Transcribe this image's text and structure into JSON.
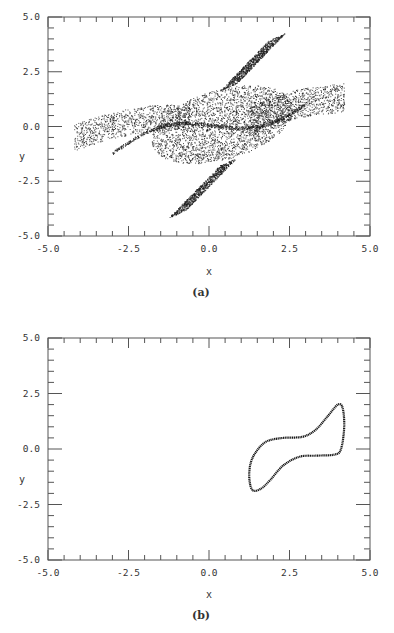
{
  "chart_data": [
    {
      "type": "scatter",
      "panel": "a",
      "caption": "(a)",
      "title": "",
      "xlabel": "x",
      "ylabel": "y",
      "xlim": [
        -5.0,
        5.0
      ],
      "ylim": [
        -5.0,
        5.0
      ],
      "xticks": [
        "-5.0",
        "-2.5",
        "0.0",
        "2.5",
        "5.0"
      ],
      "yticks": [
        "-5.0",
        "-2.5",
        "0.0",
        "2.5",
        "5.0"
      ],
      "grid": false,
      "legend": null,
      "description": "Dense dotted chaotic/quasi-periodic phase-space attractor, elongated band from lower-left to upper-right with lobes reaching y≈4.2 near x≈2 and y≈-4.0 near x≈-1",
      "extent": {
        "x": [
          -4.3,
          4.3
        ],
        "y": [
          -4.1,
          4.2
        ]
      },
      "series": [
        {
          "name": "trajectory",
          "envelope_points": [
            [
              -4.2,
              -0.3
            ],
            [
              -3.6,
              0.2
            ],
            [
              -2.6,
              0.6
            ],
            [
              -1.8,
              1.3
            ],
            [
              -1.0,
              2.0
            ],
            [
              0.0,
              2.5
            ],
            [
              1.2,
              2.6
            ],
            [
              1.8,
              3.8
            ],
            [
              2.0,
              4.2
            ],
            [
              2.2,
              3.2
            ],
            [
              3.0,
              1.6
            ],
            [
              4.1,
              2.0
            ],
            [
              4.3,
              1.3
            ],
            [
              3.6,
              0.0
            ],
            [
              2.8,
              -0.8
            ],
            [
              2.2,
              -1.6
            ],
            [
              1.0,
              -2.2
            ],
            [
              0.0,
              -2.3
            ],
            [
              -0.8,
              -3.2
            ],
            [
              -1.0,
              -4.0
            ],
            [
              -1.5,
              -3.0
            ],
            [
              -2.6,
              -1.6
            ],
            [
              -3.8,
              -1.2
            ],
            [
              -4.3,
              -0.8
            ]
          ]
        }
      ]
    },
    {
      "type": "line",
      "panel": "b",
      "caption": "(b)",
      "title": "",
      "xlabel": "x",
      "ylabel": "y",
      "xlim": [
        -5.0,
        5.0
      ],
      "ylim": [
        -5.0,
        5.0
      ],
      "xticks": [
        "-5.0",
        "-2.5",
        "0.0",
        "2.5",
        "5.0"
      ],
      "yticks": [
        "-5.0",
        "-2.5",
        "0.0",
        "2.5",
        "5.0"
      ],
      "grid": false,
      "legend": null,
      "description": "Closed limit cycle (tilted figure-S loop) in the right half of the plane",
      "series": [
        {
          "name": "limit-cycle",
          "points": [
            [
              1.35,
              -1.85
            ],
            [
              1.25,
              -1.3
            ],
            [
              1.3,
              -0.6
            ],
            [
              1.5,
              -0.05
            ],
            [
              1.8,
              0.35
            ],
            [
              2.3,
              0.5
            ],
            [
              2.9,
              0.55
            ],
            [
              3.3,
              0.85
            ],
            [
              3.7,
              1.5
            ],
            [
              4.0,
              2.0
            ],
            [
              4.15,
              1.85
            ],
            [
              4.2,
              1.0
            ],
            [
              4.1,
              0.0
            ],
            [
              3.9,
              -0.25
            ],
            [
              3.3,
              -0.3
            ],
            [
              2.8,
              -0.35
            ],
            [
              2.3,
              -0.75
            ],
            [
              1.9,
              -1.4
            ],
            [
              1.6,
              -1.8
            ],
            [
              1.35,
              -1.85
            ]
          ]
        }
      ]
    }
  ],
  "layout": {
    "panels": [
      {
        "id": "a",
        "frame": {
          "left": 48,
          "top": 17,
          "right": 370,
          "bottom": 236
        },
        "xlabel_y": 275,
        "caption_y": 296
      },
      {
        "id": "b",
        "frame": {
          "left": 48,
          "top": 338,
          "right": 370,
          "bottom": 560
        },
        "xlabel_y": 598,
        "caption_y": 619
      }
    ],
    "ink_color": "#1a1a1a",
    "frame_color": "#555555",
    "minor_ticks_per_major": 5
  }
}
